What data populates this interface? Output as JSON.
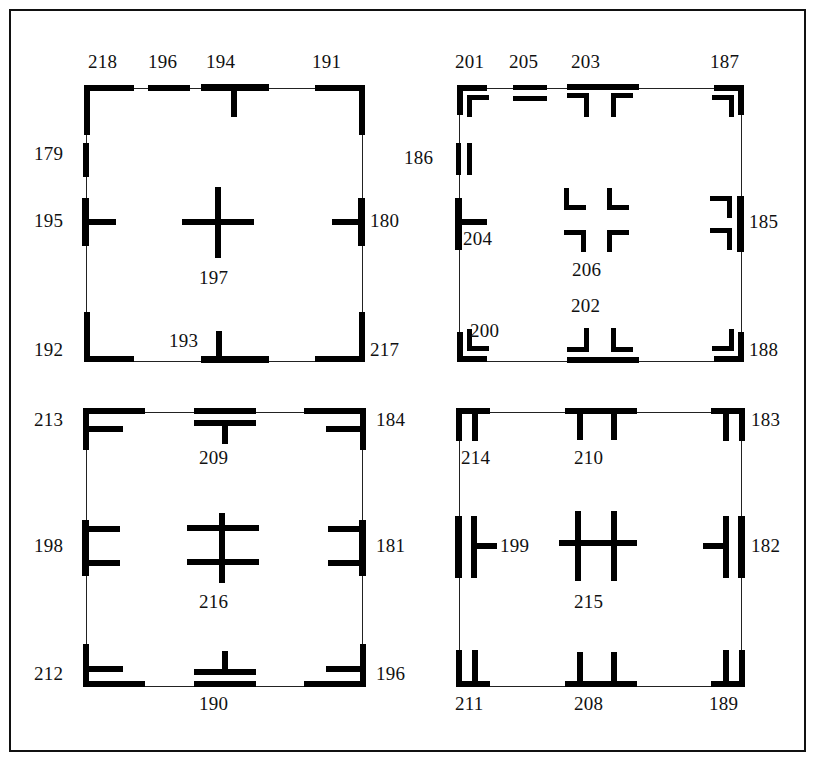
{
  "figure": {
    "title": "",
    "background_color": "#ffffff",
    "ink_color": "#000000",
    "frame_color": "#111111",
    "panel_count": 4
  },
  "panels": [
    {
      "id": "panel-top-left",
      "position": "top-left",
      "center_mark": {
        "label": "197",
        "glyph": "plus-cross"
      },
      "marks": [
        {
          "label": "218",
          "glyph": "corner-top-left-thick",
          "edge": "top",
          "side": "left"
        },
        {
          "label": "196",
          "glyph": "short-bar-horizontal",
          "edge": "top",
          "side": "center-left"
        },
        {
          "label": "194",
          "glyph": "tee-down",
          "edge": "top",
          "side": "center"
        },
        {
          "label": "191",
          "glyph": "corner-top-right-thick",
          "edge": "top",
          "side": "right"
        },
        {
          "label": "179",
          "glyph": "short-bar-vertical",
          "edge": "left",
          "side": "upper"
        },
        {
          "label": "195",
          "glyph": "tee-right",
          "edge": "left",
          "side": "middle"
        },
        {
          "label": "192",
          "glyph": "corner-bottom-left-thick",
          "edge": "bottom",
          "side": "left"
        },
        {
          "label": "193",
          "glyph": "tee-up",
          "edge": "bottom",
          "side": "center"
        },
        {
          "label": "217",
          "glyph": "corner-bottom-right-thick",
          "edge": "bottom",
          "side": "right"
        },
        {
          "label": "180",
          "glyph": "tee-left",
          "edge": "right",
          "side": "middle"
        }
      ]
    },
    {
      "id": "panel-top-right",
      "position": "top-right",
      "center_mark": {
        "label": "206",
        "glyph": "four-corner-brackets"
      },
      "marks": [
        {
          "label": "201",
          "glyph": "corner-bracket-nested-tl",
          "edge": "top",
          "side": "left"
        },
        {
          "label": "205",
          "glyph": "double-bar-horizontal",
          "edge": "top",
          "side": "center-left"
        },
        {
          "label": "203",
          "glyph": "bar-with-two-brackets-down",
          "edge": "top",
          "side": "center"
        },
        {
          "label": "187",
          "glyph": "corner-bracket-nested-tr",
          "edge": "top",
          "side": "right"
        },
        {
          "label": "186",
          "glyph": "double-bar-vertical",
          "edge": "left",
          "side": "upper"
        },
        {
          "label": "204",
          "glyph": "tee-right",
          "edge": "left",
          "side": "middle"
        },
        {
          "label": "200",
          "glyph": "corner-bracket-nested-bl",
          "edge": "bottom",
          "side": "left"
        },
        {
          "label": "202",
          "glyph": "bar-with-two-brackets-up",
          "edge": "bottom",
          "side": "center"
        },
        {
          "label": "188",
          "glyph": "corner-bracket-nested-br",
          "edge": "bottom",
          "side": "right"
        },
        {
          "label": "185",
          "glyph": "bar-with-two-brackets-left",
          "edge": "right",
          "side": "middle"
        }
      ]
    },
    {
      "id": "panel-bottom-left",
      "position": "bottom-left",
      "center_mark": {
        "label": "216",
        "glyph": "double-crossbar-vertical"
      },
      "marks": [
        {
          "label": "213",
          "glyph": "eff-corner-top-left",
          "edge": "top",
          "side": "left"
        },
        {
          "label": "209",
          "glyph": "bar-over-tee-down",
          "edge": "top",
          "side": "center"
        },
        {
          "label": "184",
          "glyph": "eff-corner-top-right",
          "edge": "top",
          "side": "right"
        },
        {
          "label": "198",
          "glyph": "double-tee-right",
          "edge": "left",
          "side": "middle"
        },
        {
          "label": "212",
          "glyph": "eff-corner-bottom-left",
          "edge": "bottom",
          "side": "left"
        },
        {
          "label": "190",
          "glyph": "bar-under-tee-up",
          "edge": "bottom",
          "side": "center"
        },
        {
          "label": "196",
          "glyph": "eff-corner-bottom-right",
          "edge": "bottom",
          "side": "right"
        },
        {
          "label": "181",
          "glyph": "double-tee-left",
          "edge": "right",
          "side": "middle"
        }
      ]
    },
    {
      "id": "panel-bottom-right",
      "position": "bottom-right",
      "center_mark": {
        "label": "215",
        "glyph": "aitch-double-vertical"
      },
      "marks": [
        {
          "label": "214",
          "glyph": "double-drop-top-left",
          "edge": "top",
          "side": "left"
        },
        {
          "label": "210",
          "glyph": "bar-with-two-drops-down",
          "edge": "top",
          "side": "center"
        },
        {
          "label": "183",
          "glyph": "double-drop-top-right",
          "edge": "top",
          "side": "right"
        },
        {
          "label": "199",
          "glyph": "thick-bar-with-tee-right",
          "edge": "left",
          "side": "middle"
        },
        {
          "label": "211",
          "glyph": "double-drop-bottom-left",
          "edge": "bottom",
          "side": "left"
        },
        {
          "label": "208",
          "glyph": "bar-with-two-drops-up",
          "edge": "bottom",
          "side": "center"
        },
        {
          "label": "189",
          "glyph": "double-drop-bottom-right",
          "edge": "bottom",
          "side": "right"
        },
        {
          "label": "182",
          "glyph": "thick-bar-with-tee-left",
          "edge": "right",
          "side": "middle"
        }
      ]
    }
  ],
  "all_labels": [
    "218",
    "196",
    "194",
    "191",
    "179",
    "195",
    "197",
    "180",
    "192",
    "193",
    "217",
    "201",
    "205",
    "203",
    "187",
    "186",
    "204",
    "206",
    "185",
    "200",
    "202",
    "188",
    "213",
    "209",
    "184",
    "198",
    "216",
    "181",
    "212",
    "190",
    "196",
    "214",
    "210",
    "183",
    "199",
    "215",
    "182",
    "211",
    "208",
    "189"
  ]
}
